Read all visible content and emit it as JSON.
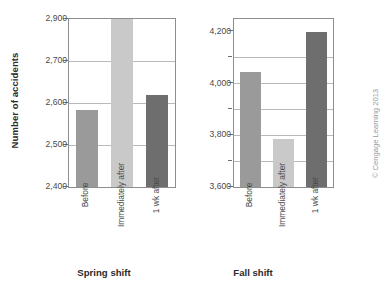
{
  "figure": {
    "ylabel": "Number of accidents",
    "credit": "© Cengage Learning 2013"
  },
  "chart_data": {
    "type": "bar",
    "title": "",
    "xlabel": "",
    "ylabel": "Number of accidents",
    "grid": true,
    "legend": "none",
    "panels": [
      {
        "caption": "Spring shift",
        "categories": [
          "Before",
          "Immediately after",
          "1 wk after"
        ],
        "values": [
          2583,
          2900,
          2620
        ],
        "ylim": [
          2400,
          2900
        ],
        "ytick_labels": [
          "2,400",
          "2,500",
          "2,600",
          "2,700",
          "2,900"
        ],
        "ytick_values": [
          2400,
          2500,
          2600,
          2700,
          2900
        ],
        "axis_note": "non-linear: 2,700 to 2,900 interval drawn same height as 100-unit intervals",
        "bar_colors": [
          "#9a9a9a",
          "#c9c9c9",
          "#6e6e6e"
        ]
      },
      {
        "caption": "Fall shift",
        "categories": [
          "Before",
          "Immediately after",
          "1 wk after"
        ],
        "values": [
          4045,
          3785,
          4205
        ],
        "ylim": [
          3600,
          4250
        ],
        "ytick_labels": [
          "3,600",
          "3,800",
          "4,000",
          "4,200"
        ],
        "ytick_values": [
          3600,
          3800,
          4000,
          4200
        ],
        "minor_tick_values": [
          3700,
          3900,
          4100
        ],
        "bar_colors": [
          "#9a9a9a",
          "#c9c9c9",
          "#6e6e6e"
        ]
      }
    ]
  }
}
